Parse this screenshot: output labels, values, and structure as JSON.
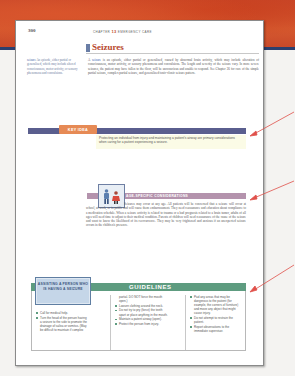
{
  "page": {
    "number": "300",
    "running_head": {
      "prefix": "CHAPTER",
      "chapter_num": "13",
      "title": "EMERGENCY CARE"
    }
  },
  "section": {
    "title": "Seizures",
    "glossary": {
      "term": "seizure",
      "definition": "An episode, either partial or generalized, which may include altered consciousness, motor activity, or sensory phenomena and convulsions."
    },
    "body": {
      "lead": "A ",
      "term": "seizure",
      "text": " is an episode, either partial or generalized, caused by abnormal brain activity, which may include alteration of consciousness, motor activity, or sensory phenomena and convulsions. The length and severity of the seizure vary. In more severe seizures, the patient may have fallen to the floor, will be unconscious and unable to respond. See Chapter 26 for care of the simple partial seizure, complex partial seizure, and generalized tonic-clonic seizure pattern."
    }
  },
  "key_idea": {
    "label": "KEY IDEA",
    "text": "Protecting an individual from injury and maintaining a patient's airway are primary considerations when caring for a patient experiencing a seizure."
  },
  "age_specific": {
    "label": "AGE-SPECIFIC CONSIDERATIONS",
    "icon": "family-icon",
    "text": "Seizures may occur at any age. All patients will be concerned that a seizure will occur at school, at work, or in public and will cause them embarrassment. They need reassurance and education about compliance to a medication schedule. When a seizure activity is related to trauma or a bad prognosis related to a brain tumor, adults of all ages will need time to adjust to their medical condition. Parents of children will need reassurance of the cause of the seizure and want to know the likelihood of its reoccurrence. They may be very frightened and anxious if an unexpected seizure occurs in the children's presence."
  },
  "guidelines": {
    "title": "GUIDELINES",
    "box_label": "ASSISTING A PERSON WHO IS HAVING A SEIZURE",
    "columns": [
      {
        "items": [
          {
            "text": "Call for medical help."
          },
          {
            "text": "Turn the head of the person having a seizure to the side to promote the drainage of saliva or vomitus. (May be difficult to maintain if complex"
          }
        ]
      },
      {
        "items": [
          {
            "text": "partial. DO NOT force the mouth open.)",
            "continuation": true
          },
          {
            "text": "Loosen clothing around the neck."
          },
          {
            "text": "Do not try to pry (force) the teeth apart or place anything in the mouth."
          },
          {
            "text": "Maintain a patent airway (open)."
          },
          {
            "text": "Protect the person from injury."
          }
        ]
      },
      {
        "items": [
          {
            "text": "Pad any areas that may be dangerous to the patient (for example, the corners of furniture) and move any object that might cause injury."
          },
          {
            "text": "Do not attempt to restrain the patient."
          },
          {
            "text": "Report observations to the immediate supervisor."
          }
        ]
      }
    ]
  },
  "annotations": {
    "arrow_color": "#e0504a",
    "arrows": [
      "key-idea-arrow",
      "age-specific-arrow",
      "guidelines-arrow"
    ]
  },
  "colors": {
    "section_title": "#b8462b",
    "key_idea_bar": "#5a5e8e",
    "key_idea_tab": "#e68a55",
    "age_bar": "#b493ad",
    "guidelines_bar": "#5e9c80",
    "guidelines_label_bg": "#c5d6e8"
  }
}
